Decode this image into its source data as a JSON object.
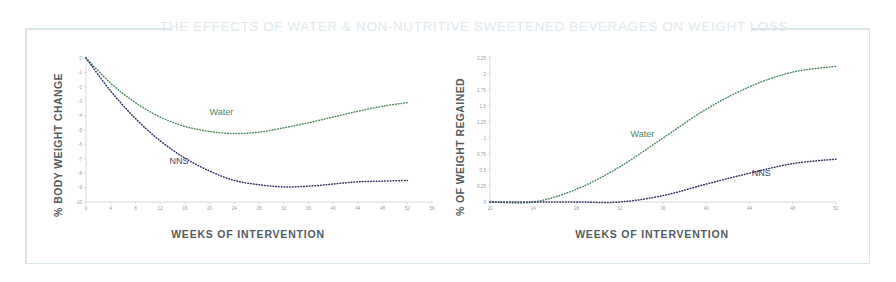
{
  "banner": {
    "title": "THE EFFECTS OF WATER & NON-NUTRITIVE SWEETENED BEVERAGES ON WEIGHT LOSS",
    "frame_color": "#d9e7e6",
    "title_color": "#dfeaee"
  },
  "colors": {
    "water": "#4d8b5f",
    "nns": "#2e2f62",
    "axis": "#c3c8cb",
    "axis_text": "#555a5c",
    "tick_text": "#9aa0a4"
  },
  "chart_data": [
    {
      "type": "line",
      "title": "",
      "xlabel": "WEEKS OF INTERVENTION",
      "ylabel": "% BODY WEIGHT CHANGE",
      "xlim": [
        0,
        56
      ],
      "ylim": [
        -10,
        0
      ],
      "xticks": [
        0,
        4,
        8,
        12,
        16,
        20,
        24,
        28,
        32,
        36,
        40,
        44,
        48,
        52,
        56
      ],
      "yticks": [
        0,
        -1,
        -2,
        -3,
        -4,
        -5,
        -6,
        -7,
        -8,
        -9,
        -10
      ],
      "grid": false,
      "legend_position": "inline-annotation",
      "series": [
        {
          "name": "Water",
          "color": "#4d8b5f",
          "x": [
            0,
            4,
            8,
            12,
            16,
            20,
            24,
            28,
            32,
            36,
            40,
            44,
            48,
            52
          ],
          "values": [
            0,
            -1.75,
            -3.1,
            -4.1,
            -4.75,
            -5.1,
            -5.25,
            -5.15,
            -4.85,
            -4.5,
            -4.1,
            -3.7,
            -3.35,
            -3.1
          ]
        },
        {
          "name": "NNS",
          "color": "#2e2f62",
          "x": [
            0,
            4,
            8,
            12,
            16,
            20,
            24,
            28,
            32,
            36,
            40,
            44,
            48,
            52
          ],
          "values": [
            0,
            -2.3,
            -4.2,
            -5.75,
            -6.95,
            -7.85,
            -8.5,
            -8.8,
            -8.95,
            -8.9,
            -8.75,
            -8.6,
            -8.55,
            -8.5
          ]
        }
      ]
    },
    {
      "type": "line",
      "title": "",
      "xlabel": "WEEKS OF INTERVENTION",
      "ylabel": "% OF WEIGHT REGAINED",
      "xlim": [
        20,
        52
      ],
      "ylim": [
        0,
        2.25
      ],
      "xticks": [
        20,
        24,
        28,
        32,
        36,
        40,
        44,
        48,
        52
      ],
      "yticks": [
        0,
        0.25,
        0.5,
        0.75,
        1,
        1.25,
        1.5,
        1.75,
        2,
        2.25
      ],
      "grid": false,
      "legend_position": "inline-annotation",
      "series": [
        {
          "name": "Water",
          "color": "#4d8b5f",
          "x": [
            20,
            24,
            28,
            32,
            36,
            40,
            44,
            48,
            52
          ],
          "values": [
            0,
            0.0,
            0.2,
            0.55,
            1.0,
            1.45,
            1.8,
            2.03,
            2.12
          ]
        },
        {
          "name": "NNS",
          "color": "#2e2f62",
          "x": [
            20,
            24,
            28,
            32,
            36,
            40,
            44,
            48,
            52
          ],
          "values": [
            0,
            0.0,
            0.0,
            0.0,
            0.1,
            0.28,
            0.45,
            0.6,
            0.67
          ]
        }
      ]
    }
  ],
  "annotations": {
    "left_water": "Water",
    "left_nns": "NNS",
    "right_water": "Water",
    "right_nns": "NNS"
  }
}
